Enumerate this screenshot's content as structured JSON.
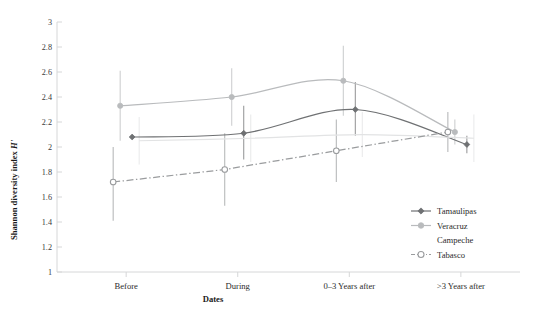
{
  "chart_data": {
    "type": "line",
    "title": "",
    "xlabel": "Dates",
    "ylabel": "Shannon diversity index H'",
    "ylabel_plain": "Shannon diversity index",
    "ylabel_italic": "H'",
    "categories": [
      "Before",
      "During",
      "0–3 Years after",
      ">3 Years after"
    ],
    "ylim": [
      1,
      3
    ],
    "yticks": [
      "1",
      "1.2",
      "1.4",
      "1.6",
      "1.8",
      "2",
      "2.2",
      "2.4",
      "2.6",
      "2.8",
      "3"
    ],
    "ytick_values": [
      1,
      1.2,
      1.4,
      1.6,
      1.8,
      2,
      2.2,
      2.4,
      2.6,
      2.8,
      3
    ],
    "grid": false,
    "legend_position": "right-bottom",
    "series": [
      {
        "name": "Tamaulipas",
        "color": "#6f7173",
        "marker": "filled-diamond",
        "line_style": "solid",
        "values": [
          2.08,
          2.11,
          2.3,
          2.02
        ],
        "err_low": [
          2.08,
          1.9,
          2.09,
          1.95
        ],
        "err_high": [
          2.08,
          2.33,
          2.52,
          2.09
        ],
        "smooth": true
      },
      {
        "name": "Veracruz",
        "color": "#b9bbbd",
        "marker": "filled-circle",
        "line_style": "solid",
        "values": [
          2.33,
          2.4,
          2.53,
          2.12
        ],
        "err_low": [
          2.05,
          2.17,
          2.25,
          2.02
        ],
        "err_high": [
          2.61,
          2.63,
          2.81,
          2.22
        ],
        "smooth": true
      },
      {
        "name": "Campeche",
        "color": "#e2e3e4",
        "marker": "none",
        "line_style": "solid",
        "values": [
          2.05,
          2.07,
          2.1,
          2.07
        ],
        "err_low": [
          1.86,
          1.88,
          1.92,
          1.88
        ],
        "err_high": [
          2.24,
          2.26,
          2.28,
          2.26
        ],
        "smooth": true
      },
      {
        "name": "Tabasco",
        "color": "#9a9c9e",
        "marker": "open-circle",
        "line_style": "dash-dot",
        "values": [
          1.72,
          1.82,
          1.97,
          2.12
        ],
        "err_low": [
          1.41,
          1.53,
          1.72,
          1.96
        ],
        "err_high": [
          2.0,
          2.11,
          2.22,
          2.28
        ],
        "smooth": false
      }
    ]
  },
  "legend": {
    "items": [
      {
        "label": "Tamaulipas",
        "color": "#6f7173",
        "marker": "filled-diamond",
        "line_style": "solid"
      },
      {
        "label": "Veracruz",
        "color": "#b9bbbd",
        "marker": "filled-circle",
        "line_style": "solid"
      },
      {
        "label": "Campeche",
        "color": "#e2e3e4",
        "marker": "none",
        "line_style": "solid"
      },
      {
        "label": "Tabasco",
        "color": "#9a9c9e",
        "marker": "open-circle",
        "line_style": "dash-dot"
      }
    ]
  },
  "axes": {
    "x_axis_title": "Dates",
    "y_axis_title_plain": "Shannon diversity index ",
    "y_axis_title_italic": "Hʹ"
  },
  "colors": {
    "axis": "#d6d7d8",
    "text": "#231f20",
    "tamaulipas": "#6f7173",
    "veracruz": "#b9bbbd",
    "campeche": "#e2e3e4",
    "tabasco": "#9a9c9e"
  }
}
